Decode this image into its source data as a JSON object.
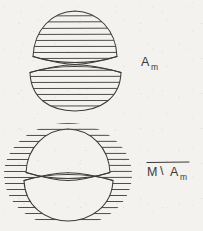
{
  "page": {
    "background_color": "#f3f2ee",
    "ink_color": "#3b3a38",
    "width": 203,
    "height": 231,
    "medium": "hand-drawn pen sketch on scanned paper"
  },
  "figures": [
    {
      "id": "figure-upper",
      "shape": "hourglass",
      "description": "Two lens-shaped lobes meeting at a central pinch point; interiors filled with horizontal hatching.",
      "hatching": "inside",
      "label": {
        "base": "A",
        "subscript": "m",
        "overline": false,
        "plain": "A_m"
      }
    },
    {
      "id": "figure-lower",
      "shape": "hourglass-complement",
      "description": "Same hourglass silhouette left white; horizontal hatching fills the surrounding circular region outside the lobes.",
      "hatching": "outside",
      "label": {
        "base": "M",
        "operator": "\\",
        "operand_base": "A",
        "subscript": "m",
        "overline": true,
        "plain": "M \\ A_m"
      }
    }
  ],
  "labels": {
    "upper_base": "A",
    "upper_sub": "m",
    "lower_m": "M",
    "lower_setminus": "\\",
    "lower_a": "A",
    "lower_sub": "m"
  }
}
